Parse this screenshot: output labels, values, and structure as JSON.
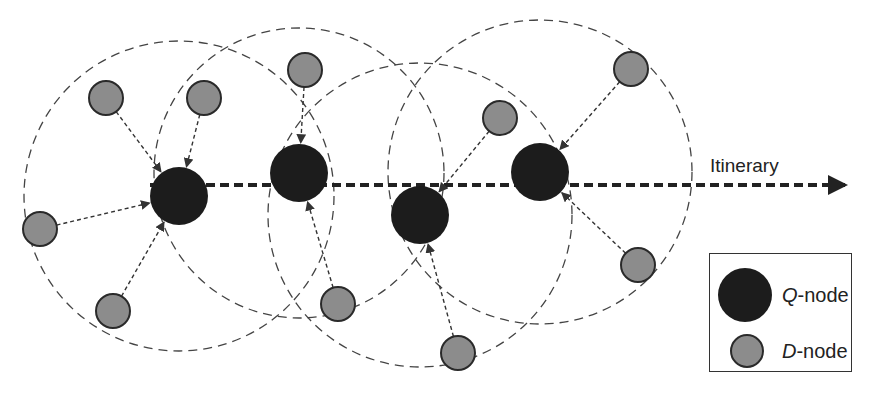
{
  "diagram": {
    "title": "",
    "itinerary_label": "Itinerary",
    "colors": {
      "q_node_fill": "#1c1c1c",
      "d_node_fill": "#8c8c8c",
      "d_node_stroke": "#2a2a2a",
      "range_circle_stroke": "#444444",
      "edge_stroke": "#333333",
      "itinerary_stroke": "#222222"
    },
    "q_nodes": [
      {
        "id": "Q1",
        "x": 179,
        "y": 196,
        "r": 29,
        "range_radius": 155
      },
      {
        "id": "Q2",
        "x": 299,
        "y": 173,
        "r": 29,
        "range_radius": 145
      },
      {
        "id": "Q3",
        "x": 420,
        "y": 215,
        "r": 29,
        "range_radius": 152
      },
      {
        "id": "Q4",
        "x": 540,
        "y": 172,
        "r": 29,
        "range_radius": 152
      }
    ],
    "d_nodes": [
      {
        "id": "D1",
        "x": 106,
        "y": 98,
        "r": 17,
        "target": "Q1"
      },
      {
        "id": "D2",
        "x": 204,
        "y": 98,
        "r": 17,
        "target": "Q1"
      },
      {
        "id": "D3",
        "x": 40,
        "y": 229,
        "r": 17,
        "target": "Q1"
      },
      {
        "id": "D4",
        "x": 113,
        "y": 311,
        "r": 17,
        "target": "Q1"
      },
      {
        "id": "D5",
        "x": 305,
        "y": 70,
        "r": 17,
        "target": "Q2"
      },
      {
        "id": "D6",
        "x": 338,
        "y": 304,
        "r": 17,
        "target": "Q2"
      },
      {
        "id": "D7",
        "x": 500,
        "y": 118,
        "r": 17,
        "target": "Q3"
      },
      {
        "id": "D8",
        "x": 458,
        "y": 353,
        "r": 17,
        "target": "Q3"
      },
      {
        "id": "D9",
        "x": 631,
        "y": 69,
        "r": 17,
        "target": "Q4"
      },
      {
        "id": "D10",
        "x": 638,
        "y": 265,
        "r": 17,
        "target": "Q4"
      }
    ],
    "itinerary": {
      "x1": 150,
      "y": 185,
      "x2": 850
    }
  },
  "legend": {
    "items": [
      {
        "symbol": "Q",
        "suffix": "-node",
        "kind": "q-node"
      },
      {
        "symbol": "D",
        "suffix": "-node",
        "kind": "d-node"
      }
    ]
  }
}
